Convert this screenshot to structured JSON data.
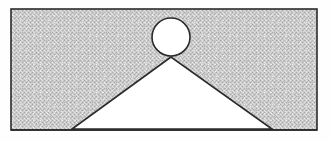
{
  "figure": {
    "canvas": {
      "width": 331,
      "height": 141,
      "background": "#fefefe"
    },
    "colors": {
      "stroke": "#2b2b2b",
      "shaded_fill": "#c9c9c9",
      "shaded_fill_dither_dark": "#a8a8a8",
      "shaded_fill_dither_light": "#e6e6e6",
      "cutout_fill": "#ffffff",
      "page_background": "#fefefe"
    },
    "stroke_width": 1.6,
    "shapes": [
      {
        "name": "outer-rectangle",
        "type": "rect",
        "x": 11,
        "y": 9,
        "width": 306,
        "height": 121,
        "fill": "shaded",
        "stroke": "#2b2b2b",
        "label": "rectangle"
      },
      {
        "name": "triangle-cutout",
        "type": "polygon",
        "points": "171,57 72,129 272,129",
        "apex": {
          "x": 171,
          "y": 57
        },
        "base_left": {
          "x": 72,
          "y": 129
        },
        "base_right": {
          "x": 272,
          "y": 129
        },
        "fill": "white",
        "stroke": "#2b2b2b",
        "label": "triangle"
      },
      {
        "name": "circle-cutout",
        "type": "circle",
        "cx": 171,
        "cy": 37,
        "r": 19,
        "fill": "white",
        "stroke": "#2b2b2b",
        "label": "circle"
      }
    ]
  }
}
